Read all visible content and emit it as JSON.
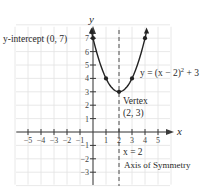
{
  "chart_data": {
    "type": "line",
    "title": "",
    "xlabel": "x",
    "ylabel": "y",
    "xlim": [
      -6,
      6
    ],
    "ylim": [
      -4,
      8
    ],
    "grid": true,
    "x_ticks": [
      -5,
      -4,
      -3,
      -2,
      -1,
      1,
      2,
      3,
      4,
      5
    ],
    "x_tick_labels": [
      "−5",
      "−4",
      "−3",
      "−2",
      "−1",
      "1",
      "2",
      "3",
      "4",
      "5"
    ],
    "y_ticks": [
      -3,
      -2,
      -1,
      1,
      2,
      3,
      4,
      5,
      6,
      7
    ],
    "y_tick_labels": [
      "−3",
      "−2",
      "−1",
      "1",
      "2",
      "3",
      "4",
      "5",
      "6",
      "7"
    ],
    "series": [
      {
        "name": "parabola",
        "equation": "y = (x − 2)² + 3",
        "h": 2,
        "k": 3,
        "a": 1,
        "x_range": [
          -0.1,
          4.1
        ],
        "points": [
          {
            "x": 0,
            "y": 7
          },
          {
            "x": 1,
            "y": 4
          },
          {
            "x": 2,
            "y": 3
          },
          {
            "x": 3,
            "y": 4
          },
          {
            "x": 4,
            "y": 7
          }
        ]
      }
    ],
    "axis_of_symmetry": {
      "x": 2,
      "style": "dashed"
    },
    "annotations": {
      "y_intercept": "y-intercept (0, 7)",
      "equation_prefix": "y = (x − 2)",
      "equation_exp": "2",
      "equation_suffix": " + 3",
      "vertex_line1": "Vertex",
      "vertex_line2": "(2, 3)",
      "aos_line1": "x = 2",
      "aos_line2": "Axis of Symmetry"
    }
  }
}
